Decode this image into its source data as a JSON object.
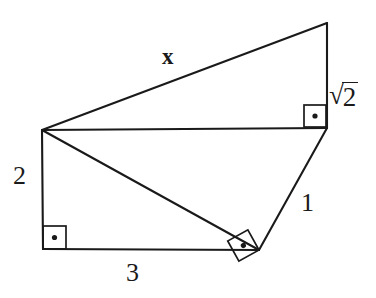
{
  "figure": {
    "background_color": "#ffffff",
    "stroke_color": "#1a1a1a",
    "labels": {
      "hypotenuse_x": "x",
      "sqrt_symbol": "√",
      "sqrt_radicand": "2",
      "sqrt_two_full": "√2",
      "left_side_2": "2",
      "bottom_side_3": "3",
      "right_side_1": "1"
    },
    "vertices": {
      "apex_left": {
        "x": 42,
        "y": 130
      },
      "top_right": {
        "x": 327,
        "y": 23
      },
      "mid_right": {
        "x": 327,
        "y": 128
      },
      "bottom_right": {
        "x": 259,
        "y": 250
      },
      "bottom_left": {
        "x": 43,
        "y": 249
      }
    },
    "segments": [
      {
        "name": "segment-x",
        "label": "x",
        "from": "apex_left",
        "to": "top_right"
      },
      {
        "name": "segment-sqrt2",
        "label": "√2",
        "from": "top_right",
        "to": "mid_right"
      },
      {
        "name": "segment-horizontal",
        "label": "",
        "from": "apex_left",
        "to": "mid_right"
      },
      {
        "name": "segment-one",
        "label": "1",
        "from": "mid_right",
        "to": "bottom_right"
      },
      {
        "name": "segment-diagonal",
        "label": "",
        "from": "apex_left",
        "to": "bottom_right"
      },
      {
        "name": "segment-three",
        "label": "3",
        "from": "bottom_left",
        "to": "bottom_right"
      },
      {
        "name": "segment-two",
        "label": "2",
        "from": "apex_left",
        "to": "bottom_left"
      }
    ],
    "right_angle_markers": [
      {
        "name": "right-angle-upper-right",
        "at": "mid_right",
        "rotation_deg": 0
      },
      {
        "name": "right-angle-bottom-left",
        "at": "bottom_left",
        "rotation_deg": 0
      },
      {
        "name": "right-angle-bottom-right",
        "at": "bottom_right",
        "rotation_deg": -29
      }
    ]
  }
}
